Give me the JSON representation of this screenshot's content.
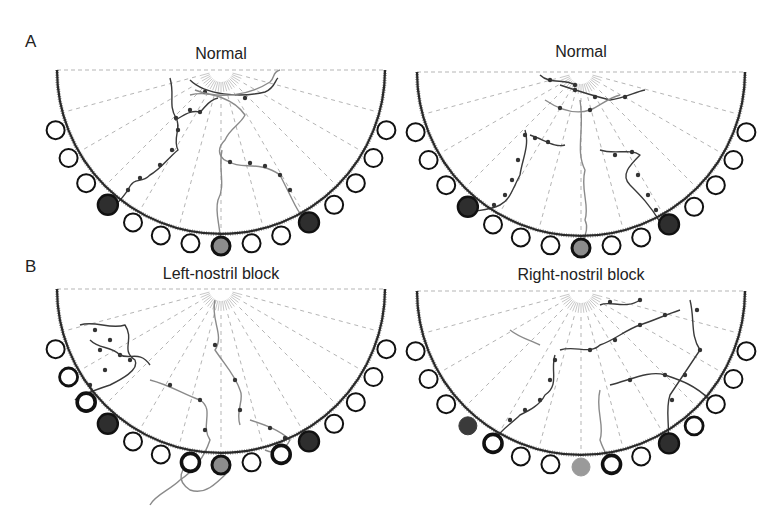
{
  "figure": {
    "row_labels": [
      {
        "id": "A",
        "text": "A",
        "x": 25,
        "y": 32
      },
      {
        "id": "B",
        "text": "B",
        "x": 25,
        "y": 257
      }
    ],
    "colors": {
      "arena_edge": "#2a2a2a",
      "radial_dash": "#b5b5b5",
      "ring": "#111111",
      "dark_fill": "#2e2e2e",
      "gray_fill": "#8c8c8c",
      "trace_dark": "#3a3a3a",
      "trace_gray": "#8a8a8a",
      "point": "#333333"
    },
    "arena": {
      "radius": 164,
      "port_ring_radius": 176,
      "port_radius": 9,
      "radial_inner": 26,
      "radial_angles_deg": [
        15,
        30,
        45,
        60,
        75,
        90,
        105,
        120,
        135,
        150,
        165
      ],
      "port_angles_deg": [
        20,
        30,
        40,
        50,
        60,
        70,
        80,
        90,
        100,
        110,
        120,
        130,
        140,
        150,
        160
      ]
    },
    "panels": [
      {
        "id": "A-left",
        "title": "Normal",
        "cx": 221,
        "cy": 70,
        "title_y": 52,
        "ports": {
          "60": "dark",
          "90": "gray_ringed",
          "130": "dark"
        },
        "traces": [
          {
            "color": "trace_dark",
            "d": "M170,78 C175,95 168,105 176,118 C182,128 172,138 178,150 C168,158 160,170 150,175 C140,185 135,175 128,190 C122,198 118,205 110,205",
            "points": [
              [
                176,
                118
              ],
              [
                178,
                130
              ],
              [
                172,
                150
              ],
              [
                160,
                165
              ],
              [
                140,
                178
              ],
              [
                128,
                190
              ]
            ]
          },
          {
            "color": "trace_dark",
            "d": "M175,120 C185,115 190,110 200,112 C205,108 208,100 218,98",
            "points": [
              [
                190,
                110
              ],
              [
                200,
                112
              ]
            ]
          },
          {
            "color": "trace_gray",
            "d": "M190,95 C210,90 235,100 245,115 C240,125 230,128 225,140 C215,150 220,160 230,162 C240,170 260,160 280,175 C285,185 290,195 295,205 C300,215 305,220 310,225",
            "points": [
              [
                230,
                162
              ],
              [
                250,
                163
              ],
              [
                265,
                166
              ],
              [
                280,
                175
              ],
              [
                290,
                190
              ]
            ]
          },
          {
            "color": "trace_gray",
            "d": "M222,150 C218,170 226,185 218,200 C214,215 222,228 220,246",
            "points": []
          },
          {
            "color": "trace_dark",
            "d": "M190,80 C205,95 240,98 265,92 C275,88 275,80 278,78",
            "points": [
              [
                205,
                92
              ],
              [
                245,
                98
              ]
            ]
          },
          {
            "color": "trace_gray",
            "d": "M195,90 C220,100 250,95 270,82 C275,78 272,72 280,70",
            "points": []
          }
        ]
      },
      {
        "id": "A-right",
        "title": "Normal",
        "cx": 581,
        "cy": 72,
        "title_y": 50,
        "ports": {
          "60": "dark",
          "90": "gray_ringed",
          "130": "dark"
        },
        "traces": [
          {
            "color": "trace_dark",
            "d": "M525,130 C530,145 522,160 520,175 C512,190 510,200 500,205 C490,210 480,210 470,212",
            "points": [
              [
                525,
                135
              ],
              [
                518,
                160
              ],
              [
                512,
                180
              ],
              [
                505,
                195
              ],
              [
                494,
                205
              ]
            ]
          },
          {
            "color": "trace_dark",
            "d": "M530,135 C545,140 555,148 565,145",
            "points": [
              [
                535,
                138
              ],
              [
                548,
                142
              ]
            ]
          },
          {
            "color": "trace_gray",
            "d": "M580,100 C585,130 575,150 585,170 C580,190 590,205 585,220 C590,230 582,240 581,248",
            "points": []
          },
          {
            "color": "trace_dark",
            "d": "M600,150 C615,155 630,148 640,155 C630,165 620,175 630,185 C640,195 650,205 660,222",
            "points": [
              [
                615,
                155
              ],
              [
                632,
                152
              ],
              [
                638,
                175
              ],
              [
                648,
                195
              ],
              [
                656,
                210
              ]
            ]
          },
          {
            "color": "trace_dark",
            "d": "M560,85 C575,90 590,95 610,100 C625,98 635,92 645,90",
            "points": [
              [
                575,
                90
              ],
              [
                595,
                97
              ],
              [
                625,
                97
              ]
            ]
          },
          {
            "color": "trace_gray",
            "d": "M545,100 C560,110 575,115 590,110 C600,106 608,98 620,95",
            "points": [
              [
                560,
                108
              ],
              [
                590,
                110
              ]
            ]
          },
          {
            "color": "trace_dark",
            "d": "M540,75 C550,85 565,78 575,85",
            "points": [
              [
                550,
                80
              ],
              [
                575,
                85
              ]
            ]
          }
        ]
      },
      {
        "id": "B-left",
        "title": "Left-nostril block",
        "cx": 221,
        "cy": 289,
        "title_y": 265,
        "ports": {
          "60": "dark",
          "70": "thick",
          "90": "gray_ringed",
          "100": "thick",
          "130": "dark",
          "140": "thick",
          "150": "medium"
        },
        "traces": [
          {
            "color": "trace_dark",
            "d": "M80,325 C95,320 110,330 125,325 C135,340 120,350 135,360 C140,370 120,380 110,385 C95,390 80,395 75,400",
            "points": [
              [
                95,
                330
              ],
              [
                110,
                340
              ],
              [
                120,
                355
              ],
              [
                105,
                370
              ],
              [
                90,
                385
              ]
            ]
          },
          {
            "color": "trace_dark",
            "d": "M90,340 C100,350 110,345 120,355 C130,360 140,350 150,365",
            "points": [
              [
                100,
                350
              ],
              [
                130,
                360
              ]
            ]
          },
          {
            "color": "trace_gray",
            "d": "M150,380 C170,385 185,395 200,400 C215,410 200,425 210,440 C205,455 195,470 180,480 C170,490 155,495 150,505",
            "points": [
              [
                170,
                385
              ],
              [
                200,
                400
              ],
              [
                205,
                430
              ]
            ]
          },
          {
            "color": "trace_gray",
            "d": "M215,300 C210,320 225,335 215,350 C225,365 235,375 240,390 C245,400 235,410 240,425",
            "points": [
              [
                215,
                345
              ],
              [
                235,
                380
              ],
              [
                240,
                410
              ]
            ]
          },
          {
            "color": "trace_gray",
            "d": "M250,420 C265,425 280,430 290,440 C285,450 275,455 265,450",
            "points": [
              [
                270,
                428
              ],
              [
                285,
                438
              ]
            ]
          },
          {
            "color": "trace_gray",
            "d": "M195,455 C180,470 175,480 190,490 C205,495 215,485 230,470",
            "points": []
          }
        ]
      },
      {
        "id": "B-right",
        "title": "Right-nostril block",
        "cx": 581,
        "cy": 291,
        "title_y": 266,
        "ports": {
          "50": "medium",
          "60": "dark",
          "80": "thick",
          "90": "gray_plain",
          "120": "thick",
          "130": "dark_plain"
        },
        "traces": [
          {
            "color": "trace_dark",
            "d": "M555,355 C550,370 560,385 545,395 C540,405 530,410 520,415 C510,425 500,430 495,440",
            "points": [
              [
                555,
                360
              ],
              [
                550,
                380
              ],
              [
                540,
                400
              ],
              [
                525,
                410
              ],
              [
                510,
                420
              ]
            ]
          },
          {
            "color": "trace_dark",
            "d": "M560,350 C575,345 590,355 600,345 C615,340 625,330 640,325 C655,320 665,315 680,310",
            "points": [
              [
                590,
                350
              ],
              [
                615,
                340
              ],
              [
                640,
                325
              ],
              [
                665,
                315
              ]
            ]
          },
          {
            "color": "trace_dark",
            "d": "M690,300 C695,320 690,335 700,350 C690,365 680,380 670,395 C665,410 670,425 668,440",
            "points": [
              [
                697,
                310
              ],
              [
                700,
                350
              ],
              [
                685,
                375
              ],
              [
                672,
                400
              ]
            ]
          },
          {
            "color": "trace_gray",
            "d": "M600,390 C595,410 605,425 600,440 C605,455 612,462 612,466",
            "points": []
          },
          {
            "color": "trace_dark",
            "d": "M610,385 C630,380 650,370 665,375 C680,380 695,385 710,400",
            "points": [
              [
                630,
                380
              ],
              [
                665,
                375
              ]
            ]
          },
          {
            "color": "trace_gray",
            "d": "M540,345 C530,340 520,338 510,330",
            "points": []
          },
          {
            "color": "trace_dark",
            "d": "M600,305 C610,300 625,310 640,300",
            "points": [
              [
                610,
                302
              ],
              [
                640,
                300
              ]
            ]
          }
        ]
      }
    ]
  }
}
